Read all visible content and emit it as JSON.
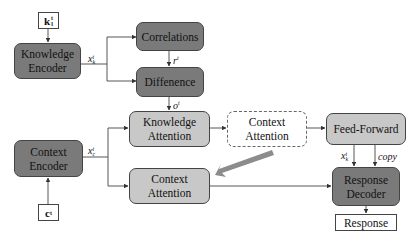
{
  "diagram": {
    "inputs": {
      "knowledge": "k",
      "knowledge_sub": "l",
      "knowledge_sup": "t",
      "context": "c",
      "context_sup": "t"
    },
    "nodes": {
      "knowledge_encoder": [
        "Knowledge",
        "Encoder"
      ],
      "correlations": "Correlations",
      "difference": "Diffenence",
      "knowledge_attention": [
        "Knowledge",
        "Attention"
      ],
      "context_attention_dashed": [
        "Context",
        "Attention"
      ],
      "feed_forward": "Feed-Forward",
      "context_encoder": [
        "Context",
        "Encoder"
      ],
      "context_attention": [
        "Context",
        "Attention"
      ],
      "response_decoder": [
        "Response",
        "Decoder"
      ],
      "response": "Response"
    },
    "edge_labels": {
      "xk": "x",
      "xk_sub": "k",
      "xk_sup": "t",
      "rt": "r",
      "rt_sup": "t",
      "ot": "o",
      "ot_sup": "t",
      "xc": "x",
      "xc_sub": "c",
      "xc_sup": "t",
      "xk_dec": "x",
      "xk_dec_sub": "k",
      "xk_dec_sup": "t",
      "copy": "copy"
    },
    "colors": {
      "dark_box": "#7a7a7a",
      "light_box": "#c8c8c8",
      "arrow_big": "#8c8c8c"
    }
  }
}
